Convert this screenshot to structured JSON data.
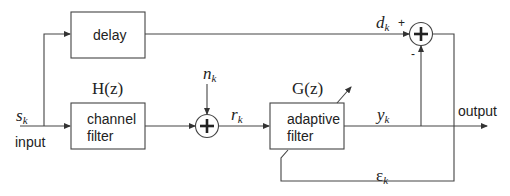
{
  "diagram": {
    "type": "block-diagram",
    "blocks": {
      "delay": {
        "label": "delay"
      },
      "channel_filter": {
        "label_line1": "channel",
        "label_line2": "filter",
        "transfer": "H(z)"
      },
      "adaptive_filter": {
        "label_line1": "adaptive",
        "label_line2": "filter",
        "transfer": "G(z)"
      }
    },
    "signals": {
      "input_symbol": "s",
      "input_sub": "k",
      "input_label": "input",
      "noise_symbol": "n",
      "noise_sub": "k",
      "received_symbol": "r",
      "received_sub": "k",
      "filter_out_symbol": "y",
      "filter_out_sub": "k",
      "desired_symbol": "d",
      "desired_sub": "k",
      "error_symbol": "ε",
      "error_sub": "k",
      "output_label": "output"
    },
    "summers": {
      "noise_sum": {
        "symbol": "+"
      },
      "error_sum": {
        "symbol": "+",
        "plus_sign": "+",
        "minus_sign": "-"
      }
    },
    "colors": {
      "line": "#333333",
      "text": "#222222",
      "background": "#ffffff"
    }
  }
}
